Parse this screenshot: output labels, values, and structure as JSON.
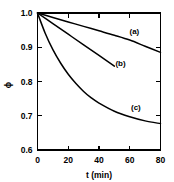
{
  "chart_data": {
    "type": "line",
    "title": "",
    "subtitle": "",
    "xlabel": "t (min)",
    "ylabel": "ϕ",
    "xlim": [
      0,
      80
    ],
    "ylim": [
      0.6,
      1.0
    ],
    "xticks": [
      0,
      20,
      40,
      60,
      80
    ],
    "yticks": [
      1.0,
      0.9,
      0.8,
      0.7,
      0.6
    ],
    "xtick_labels": [
      "0",
      "20",
      "40",
      "60",
      "80"
    ],
    "ytick_labels": [
      "1.0",
      "0.9",
      "0.8",
      "0.7",
      "0.6"
    ],
    "grid": false,
    "legend_position": "inline-annotations",
    "series": [
      {
        "name": "(a)",
        "label": "(a)",
        "label_x": 63,
        "label_y": 0.938,
        "x": [
          0,
          10,
          20,
          30,
          40,
          50,
          60,
          70,
          80
        ],
        "values": [
          1.0,
          0.987,
          0.974,
          0.961,
          0.948,
          0.935,
          0.921,
          0.903,
          0.885
        ]
      },
      {
        "name": "(b)",
        "label": "(b)",
        "label_x": 54,
        "label_y": 0.845,
        "x": [
          0,
          10,
          20,
          30,
          40,
          50
        ],
        "values": [
          1.0,
          0.969,
          0.938,
          0.907,
          0.876,
          0.845
        ]
      },
      {
        "name": "(c)",
        "label": "(c)",
        "label_x": 64,
        "label_y": 0.718,
        "x": [
          0,
          5,
          10,
          15,
          20,
          25,
          30,
          35,
          40,
          50,
          60,
          70,
          80
        ],
        "values": [
          1.0,
          0.941,
          0.893,
          0.854,
          0.821,
          0.794,
          0.771,
          0.752,
          0.737,
          0.713,
          0.697,
          0.685,
          0.677
        ]
      }
    ]
  },
  "axes": {
    "y_axis_title": "ϕ",
    "x_axis_title": "t (min)"
  },
  "colors": {
    "curve": "#000000",
    "axis": "#000000",
    "background": "#ffffff"
  }
}
